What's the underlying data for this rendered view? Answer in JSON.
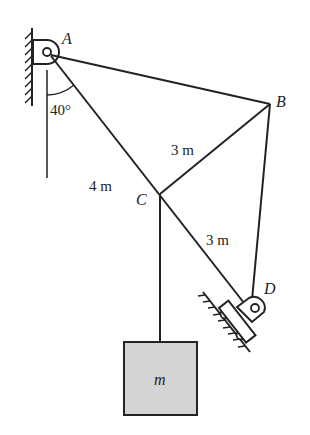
{
  "diagram": {
    "points": {
      "A": {
        "label": "A"
      },
      "B": {
        "label": "B"
      },
      "C": {
        "label": "C"
      },
      "D": {
        "label": "D"
      }
    },
    "dimensions": {
      "AC": "4 m",
      "BC": "3 m",
      "CD": "3 m"
    },
    "angle": "40°",
    "mass": "m",
    "colors": {
      "line": "#222222",
      "mass_fill": "#d4d4d4"
    }
  }
}
